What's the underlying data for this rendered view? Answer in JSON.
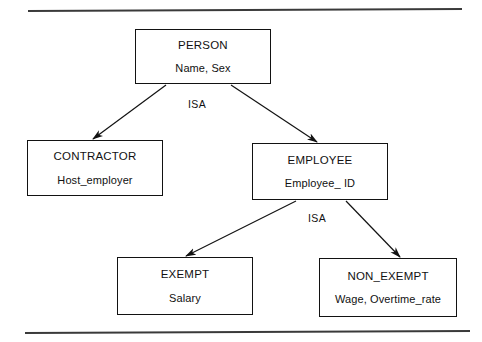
{
  "figure": {
    "title_rule_top": "horizontal-rule",
    "title_rule_bottom": "horizontal-rule"
  },
  "colors": {
    "line": "#121212",
    "text": "#111111",
    "background": "#ffffff"
  },
  "entities": [
    {
      "id": "person",
      "name": "PERSON",
      "attributes": "Name, Sex",
      "x": 135,
      "y": 29,
      "w": 136,
      "h": 55
    },
    {
      "id": "contractor",
      "name": "CONTRACTOR",
      "attributes": "Host_employer",
      "x": 27,
      "y": 140,
      "w": 136,
      "h": 56
    },
    {
      "id": "employee",
      "name": "EMPLOYEE",
      "attributes": "Employee_ ID",
      "x": 252,
      "y": 143,
      "w": 136,
      "h": 57
    },
    {
      "id": "exempt",
      "name": "EXEMPT",
      "attributes": "Salary",
      "x": 117,
      "y": 257,
      "w": 136,
      "h": 58
    },
    {
      "id": "non_exempt",
      "name": "NON_EXEMPT",
      "attributes": "Wage, Overtime_rate",
      "x": 319,
      "y": 258,
      "w": 138,
      "h": 59
    }
  ],
  "relationships": [
    {
      "id": "isa-person",
      "label": "ISA",
      "label_x": 197,
      "label_y": 104,
      "from": "person",
      "to": [
        "contractor",
        "employee"
      ]
    },
    {
      "id": "isa-employee",
      "label": "ISA",
      "label_x": 317,
      "label_y": 218,
      "from": "employee",
      "to": [
        "exempt",
        "non_exempt"
      ]
    }
  ],
  "edges": [
    {
      "id": "person-to-contractor",
      "x1": 166,
      "y1": 85,
      "x2": 93,
      "y2": 139
    },
    {
      "id": "person-to-employee",
      "x1": 231,
      "y1": 85,
      "x2": 317,
      "y2": 142
    },
    {
      "id": "employee-to-exempt",
      "x1": 296,
      "y1": 201,
      "x2": 186,
      "y2": 256
    },
    {
      "id": "employee-to-non-exempt",
      "x1": 346,
      "y1": 201,
      "x2": 400,
      "y2": 257
    }
  ],
  "rules": [
    {
      "id": "top-rule",
      "x1": 28,
      "y1": 11,
      "x2": 462,
      "y2": 9
    },
    {
      "id": "bottom-rule",
      "x1": 25,
      "y1": 333,
      "x2": 470,
      "y2": 331
    }
  ]
}
